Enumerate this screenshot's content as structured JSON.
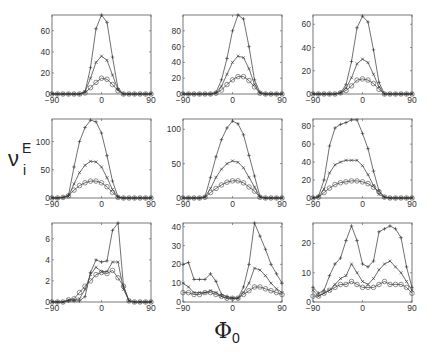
{
  "chart_data": {
    "type": "line",
    "layout": "3x3 grid of subplots",
    "xlabel": "Φ0",
    "ylabel": "ν_i^E",
    "x": [
      -90,
      -80,
      -70,
      -60,
      -50,
      -40,
      -30,
      -20,
      -10,
      0,
      10,
      20,
      30,
      40,
      50,
      60,
      70,
      80,
      90
    ],
    "xticks": [
      -90,
      0,
      90
    ],
    "xlim": [
      -90,
      90
    ],
    "series_markers": [
      "+",
      "x",
      "o"
    ],
    "panels": [
      {
        "row": 1,
        "col": 1,
        "ylim": [
          0,
          75
        ],
        "yticks": [
          0,
          20,
          40,
          60
        ],
        "series": [
          {
            "name": "+",
            "values": [
              0,
              0,
              0,
              0,
              0,
              0,
              2,
              25,
              62,
              75,
              68,
              35,
              5,
              0,
              0,
              0,
              0,
              0,
              0
            ]
          },
          {
            "name": "x",
            "values": [
              0,
              0,
              0,
              0,
              0,
              0,
              2,
              15,
              30,
              36,
              32,
              18,
              4,
              0,
              0,
              0,
              0,
              0,
              0
            ]
          },
          {
            "name": "o",
            "values": [
              0,
              0,
              0,
              0,
              0,
              0,
              1,
              6,
              11,
              15,
              14,
              9,
              3,
              0,
              0,
              0,
              0,
              0,
              0
            ]
          }
        ]
      },
      {
        "row": 1,
        "col": 2,
        "ylim": [
          0,
          100
        ],
        "yticks": [
          0,
          20,
          40,
          60,
          80
        ],
        "series": [
          {
            "name": "+",
            "values": [
              0,
              0,
              0,
              0,
              0,
              0,
              2,
              18,
              45,
              80,
              100,
              95,
              60,
              18,
              2,
              0,
              0,
              0,
              0
            ]
          },
          {
            "name": "x",
            "values": [
              0,
              0,
              0,
              0,
              0,
              0,
              1,
              10,
              25,
              40,
              48,
              46,
              32,
              12,
              1,
              0,
              0,
              0,
              0
            ]
          },
          {
            "name": "o",
            "values": [
              0,
              0,
              0,
              0,
              0,
              0,
              1,
              5,
              12,
              18,
              22,
              22,
              17,
              9,
              1,
              0,
              0,
              0,
              0
            ]
          }
        ]
      },
      {
        "row": 1,
        "col": 3,
        "ylim": [
          0,
          68
        ],
        "yticks": [
          0,
          20,
          40,
          60
        ],
        "series": [
          {
            "name": "+",
            "values": [
              0,
              0,
              0,
              0,
              0,
              1,
              8,
              28,
              57,
              67,
              62,
              38,
              10,
              0,
              0,
              0,
              0,
              0,
              0
            ]
          },
          {
            "name": "x",
            "values": [
              0,
              0,
              0,
              0,
              0,
              1,
              5,
              14,
              26,
              30,
              27,
              17,
              6,
              0,
              0,
              0,
              0,
              0,
              0
            ]
          },
          {
            "name": "o",
            "values": [
              0,
              0,
              0,
              0,
              0,
              1,
              3,
              7,
              12,
              13,
              12,
              9,
              4,
              0,
              0,
              0,
              0,
              0,
              0
            ]
          }
        ]
      },
      {
        "row": 2,
        "col": 1,
        "ylim": [
          0,
          140
        ],
        "yticks": [
          0,
          50,
          100
        ],
        "series": [
          {
            "name": "+",
            "values": [
              0,
              0,
              1,
              5,
              55,
              100,
              125,
              138,
              135,
              115,
              75,
              30,
              2,
              0,
              0,
              0,
              0,
              0,
              0
            ]
          },
          {
            "name": "x",
            "values": [
              0,
              0,
              1,
              3,
              25,
              45,
              58,
              65,
              64,
              55,
              36,
              15,
              1,
              0,
              0,
              0,
              0,
              0,
              0
            ]
          },
          {
            "name": "o",
            "values": [
              0,
              0,
              1,
              4,
              14,
              22,
              27,
              30,
              30,
              27,
              20,
              10,
              1,
              0,
              0,
              0,
              0,
              0,
              0
            ]
          }
        ]
      },
      {
        "row": 2,
        "col": 2,
        "ylim": [
          0,
          115
        ],
        "yticks": [
          0,
          50,
          100
        ],
        "series": [
          {
            "name": "+",
            "values": [
              0,
              0,
              0,
              0,
              2,
              30,
              60,
              85,
              102,
              112,
              108,
              92,
              62,
              32,
              2,
              0,
              0,
              0,
              0
            ]
          },
          {
            "name": "x",
            "values": [
              0,
              0,
              0,
              0,
              1,
              14,
              30,
              42,
              50,
              54,
              52,
              44,
              30,
              16,
              1,
              0,
              0,
              0,
              0
            ]
          },
          {
            "name": "o",
            "values": [
              0,
              0,
              0,
              0,
              1,
              8,
              14,
              19,
              23,
              25,
              25,
              22,
              16,
              10,
              1,
              0,
              0,
              0,
              0
            ]
          }
        ]
      },
      {
        "row": 2,
        "col": 3,
        "ylim": [
          0,
          88
        ],
        "yticks": [
          0,
          20,
          40,
          60,
          80
        ],
        "series": [
          {
            "name": "+",
            "values": [
              0,
              2,
              20,
              58,
              78,
              82,
              84,
              87,
              87,
              72,
              55,
              30,
              8,
              1,
              0,
              0,
              0,
              0,
              0
            ]
          },
          {
            "name": "x",
            "values": [
              0,
              1,
              10,
              28,
              37,
              40,
              42,
              42,
              42,
              36,
              26,
              14,
              4,
              1,
              0,
              0,
              0,
              0,
              0
            ]
          },
          {
            "name": "o",
            "values": [
              0,
              1,
              6,
              11,
              15,
              17,
              18,
              19,
              19,
              18,
              16,
              12,
              7,
              1,
              0,
              0,
              0,
              0,
              0
            ]
          }
        ]
      },
      {
        "row": 3,
        "col": 1,
        "ylim": [
          0,
          7.5
        ],
        "yticks": [
          0,
          2,
          4,
          6
        ],
        "series": [
          {
            "name": "+",
            "values": [
              0,
              0,
              0,
              0.1,
              0.1,
              0.1,
              0.5,
              2.8,
              4.0,
              3.8,
              3.9,
              6.8,
              7.5,
              1.5,
              0.1,
              0,
              0,
              0,
              0
            ]
          },
          {
            "name": "x",
            "values": [
              0,
              0,
              0,
              0.2,
              0.2,
              0.3,
              1.2,
              2.6,
              3.3,
              2.9,
              2.9,
              3.8,
              3.8,
              1.2,
              0.1,
              0,
              0,
              0,
              0
            ]
          },
          {
            "name": "o",
            "values": [
              0,
              0,
              0,
              0.2,
              0.3,
              0.9,
              1.5,
              2.0,
              2.6,
              2.8,
              2.7,
              3.0,
              2.3,
              1.5,
              0.1,
              0,
              0,
              0,
              0
            ]
          }
        ]
      },
      {
        "row": 3,
        "col": 2,
        "ylim": [
          0,
          42
        ],
        "yticks": [
          0,
          10,
          20,
          30,
          40
        ],
        "series": [
          {
            "name": "+",
            "values": [
              20,
              21,
              12,
              12,
              12,
              15,
              11,
              4,
              3,
              2,
              2,
              8,
              20,
              42,
              35,
              28,
              20,
              15,
              10
            ]
          },
          {
            "name": "x",
            "values": [
              10,
              8,
              5,
              5,
              5,
              6,
              5,
              3,
              2,
              2,
              2,
              5,
              10,
              18,
              17,
              14,
              10,
              7,
              5
            ]
          },
          {
            "name": "o",
            "values": [
              5,
              5,
              4,
              4,
              5,
              5,
              4,
              3,
              2,
              2,
              2,
              4,
              6,
              8,
              8,
              7,
              6,
              5,
              4
            ]
          }
        ]
      },
      {
        "row": 3,
        "col": 3,
        "ylim": [
          0,
          27
        ],
        "yticks": [
          0,
          10,
          20
        ],
        "series": [
          {
            "name": "+",
            "values": [
              5,
              3,
              4,
              9,
              13,
              15,
              21,
              26,
              21,
              13,
              12,
              14,
              24,
              25,
              26,
              25,
              22,
              12,
              5
            ]
          },
          {
            "name": "x",
            "values": [
              4,
              2,
              3,
              4,
              6,
              8,
              9,
              13,
              10,
              7,
              6,
              8,
              11,
              13,
              14,
              12,
              10,
              7,
              4
            ]
          },
          {
            "name": "o",
            "values": [
              2,
              2,
              3,
              4,
              5,
              6,
              6,
              7,
              6,
              5,
              5,
              5,
              6,
              7,
              6,
              6,
              6,
              5,
              3
            ]
          }
        ]
      }
    ]
  },
  "labels": {
    "ylabel_main": "ν",
    "ylabel_sup": "E",
    "ylabel_sub": "i",
    "xlabel_main": "Φ",
    "xlabel_sub": "0"
  }
}
